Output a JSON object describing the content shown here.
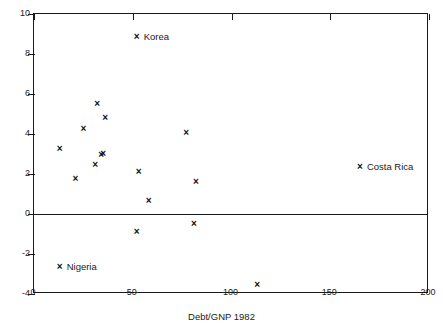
{
  "chart_data": {
    "type": "scatter",
    "title": "",
    "xlabel": "Debt/GNP 1982",
    "ylabel": "",
    "xlim": [
      0,
      200
    ],
    "ylim": [
      -4,
      10
    ],
    "xticks": [
      0,
      50,
      100,
      150,
      200
    ],
    "yticks": [
      -4,
      -2,
      0,
      2,
      4,
      6,
      8,
      10
    ],
    "grid": false,
    "legend": "none",
    "zero_line": 0,
    "marker": "x",
    "points": [
      {
        "x": 13,
        "y": 3.25,
        "label": ""
      },
      {
        "x": 21,
        "y": 1.75,
        "label": ""
      },
      {
        "x": 25,
        "y": 4.25,
        "label": ""
      },
      {
        "x": 31,
        "y": 2.45,
        "label": ""
      },
      {
        "x": 32,
        "y": 5.5,
        "label": ""
      },
      {
        "x": 34,
        "y": 2.95,
        "label": ""
      },
      {
        "x": 35,
        "y": 3.0,
        "label": ""
      },
      {
        "x": 36,
        "y": 4.8,
        "label": ""
      },
      {
        "x": 52,
        "y": 8.85,
        "label": "Korea"
      },
      {
        "x": 53,
        "y": 2.1,
        "label": ""
      },
      {
        "x": 52,
        "y": -0.9,
        "label": ""
      },
      {
        "x": 58,
        "y": 0.65,
        "label": ""
      },
      {
        "x": 77,
        "y": 4.05,
        "label": ""
      },
      {
        "x": 82,
        "y": 1.6,
        "label": ""
      },
      {
        "x": 81,
        "y": -0.5,
        "label": ""
      },
      {
        "x": 113,
        "y": -3.55,
        "label": ""
      },
      {
        "x": 165,
        "y": 2.35,
        "label": "Costa Rica"
      },
      {
        "x": 13,
        "y": -2.65,
        "label": "Nigeria"
      }
    ]
  }
}
